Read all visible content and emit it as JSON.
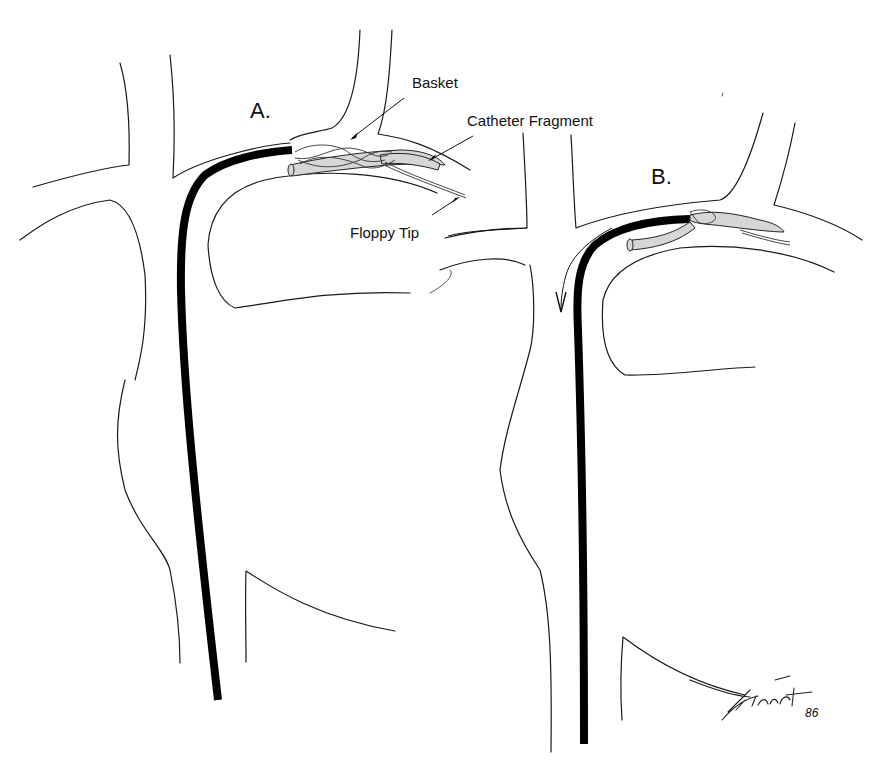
{
  "figure": {
    "panels": [
      {
        "id": "A",
        "label": "A."
      },
      {
        "id": "B",
        "label": "B."
      }
    ],
    "annotations": {
      "basket": "Basket",
      "catheter_fragment": "Catheter Fragment",
      "floppy_tip": "Floppy Tip"
    },
    "signature": {
      "name": "Finch",
      "year": "86"
    },
    "colors": {
      "ink": "#111111",
      "catheter": "#000000",
      "fragment_fill": "#d6d6d6",
      "background": "#ffffff"
    }
  }
}
